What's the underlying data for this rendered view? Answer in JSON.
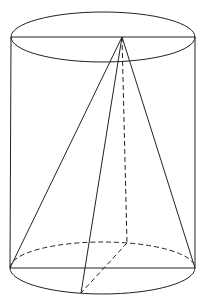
{
  "diagram": {
    "type": "cylinder-with-inscribed-pyramid",
    "top_ellipse": {
      "cx": 103,
      "cy": 37,
      "rx": 92,
      "ry": 25
    },
    "bottom_ellipse": {
      "cx": 102.5,
      "cy": 268,
      "rx": 92.5,
      "ry": 26
    },
    "apex": {
      "x": 122,
      "y": 37
    },
    "base_points": {
      "left": {
        "x": 10,
        "y": 268
      },
      "right": {
        "x": 195,
        "y": 268
      },
      "front": {
        "x": 81,
        "y": 293
      },
      "back": {
        "x": 127,
        "y": 243
      }
    },
    "stroke_color": "#222222"
  }
}
